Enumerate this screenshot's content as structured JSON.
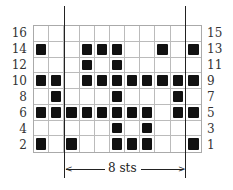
{
  "chart": {
    "columns": 11,
    "rows": 8,
    "left_labels": [
      "16",
      "14",
      "12",
      "10",
      "8",
      "6",
      "4",
      "2"
    ],
    "right_labels": [
      "15",
      "13",
      "11",
      "9",
      "7",
      "5",
      "3",
      "1"
    ],
    "repeat_label": "8 sts",
    "filled": [
      [],
      [
        0,
        3,
        4,
        5,
        8,
        10
      ],
      [
        3,
        5
      ],
      [
        0,
        1,
        3,
        4,
        5,
        6,
        7,
        8,
        9,
        10
      ],
      [
        1,
        5,
        9
      ],
      [
        0,
        1,
        2,
        3,
        4,
        5,
        6,
        7,
        9,
        10
      ],
      [
        5,
        7
      ],
      [
        0,
        2,
        5,
        6,
        7,
        10
      ]
    ],
    "fill_color": "#111111",
    "grid_color": "#bbbbbb"
  }
}
